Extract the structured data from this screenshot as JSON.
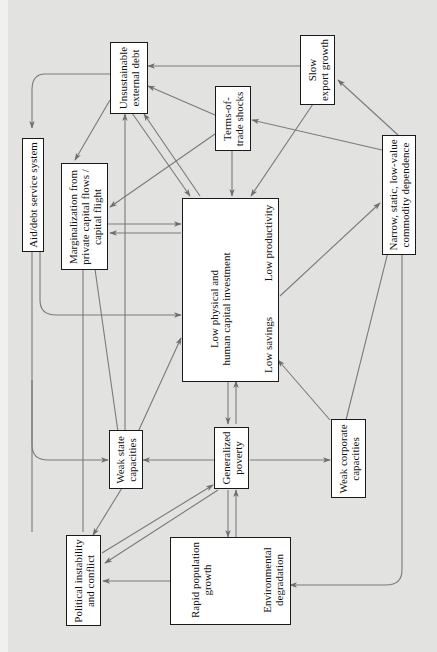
{
  "figure": {
    "orientation": "rotated-90-ccw",
    "line_color": "#777777",
    "box_border_color": "#1a1a1a",
    "background": "#e2e2e0"
  },
  "nodes": {
    "unsustainable_debt": {
      "line1": "Unsustainable",
      "line2": "external debt"
    },
    "slow_export": {
      "line1": "Slow",
      "line2": "export growth"
    },
    "terms_of_trade": {
      "line1": "Terms-of-",
      "line2": "trade shocks"
    },
    "aid_debt": {
      "line1": "Aid/debt service system"
    },
    "marginalization": {
      "line1": "Marginalization from",
      "line2": "private capital flows /",
      "line3": "capital flight"
    },
    "narrow_commodity": {
      "line1": "Narrow, static, low-value",
      "line2": "commodity dependence"
    },
    "center": {
      "investment_line1": "Low physical and",
      "investment_line2": "human capital investment",
      "productivity": "Low productivity",
      "savings": "Low savings"
    },
    "weak_state": {
      "line1": "Weak state",
      "line2": "capacities"
    },
    "generalized_poverty": {
      "line1": "Generalized",
      "line2": "poverty"
    },
    "weak_corporate": {
      "line1": "Weak corporate",
      "line2": "capacities"
    },
    "political_instability": {
      "line1": "Political instability",
      "line2": "and conflict"
    },
    "population_environment": {
      "population_line1": "Rapid population",
      "population_line2": "growth",
      "environment_line1": "Environmental",
      "environment_line2": "degradation"
    }
  },
  "edges": [
    {
      "from": "Slow export growth",
      "to": "Unsustainable external debt"
    },
    {
      "from": "Terms-of-trade shocks",
      "to": "Unsustainable external debt"
    },
    {
      "from": "Unsustainable external debt",
      "to": "Aid/debt service system"
    },
    {
      "from": "Unsustainable external debt",
      "to": "Marginalization from private capital flows / capital flight"
    },
    {
      "from": "Unsustainable external debt",
      "to": "Low physical and human capital investment"
    },
    {
      "from": "Low physical and human capital investment",
      "to": "Unsustainable external debt"
    },
    {
      "from": "Terms-of-trade shocks",
      "to": "Marginalization from private capital flows / capital flight"
    },
    {
      "from": "Terms-of-trade shocks",
      "to": "Low physical and human capital investment"
    },
    {
      "from": "Slow export growth",
      "to": "Low productivity"
    },
    {
      "from": "Narrow, static, low-value commodity dependence",
      "to": "Slow export growth"
    },
    {
      "from": "Narrow, static, low-value commodity dependence",
      "to": "Terms-of-trade shocks"
    },
    {
      "from": "Marginalization from private capital flows / capital flight",
      "to": "Low physical and human capital investment"
    },
    {
      "from": "Low physical and human capital investment",
      "to": "Marginalization from private capital flows / capital flight"
    },
    {
      "from": "Aid/debt service system",
      "to": "Low physical and human capital investment"
    },
    {
      "from": "Low physical and human capital investment",
      "to": "Low productivity"
    },
    {
      "from": "Low productivity",
      "to": "Low physical and human capital investment"
    },
    {
      "from": "Low productivity",
      "to": "Low savings"
    },
    {
      "from": "Low physical and human capital investment",
      "to": "Low savings"
    },
    {
      "from": "Low savings",
      "to": "Low physical and human capital investment"
    },
    {
      "from": "Low physical and human capital investment",
      "to": "Narrow, static, low-value commodity dependence"
    },
    {
      "from": "Low physical and human capital investment",
      "to": "Generalized poverty"
    },
    {
      "from": "Generalized poverty",
      "to": "Low physical and human capital investment"
    },
    {
      "from": "Weak corporate capacities",
      "to": "Low savings"
    },
    {
      "from": "Weak corporate capacities",
      "to": "Narrow, static, low-value commodity dependence"
    },
    {
      "from": "Weak state capacities",
      "to": "Low physical and human capital investment"
    },
    {
      "from": "Weak state capacities",
      "to": "Marginalization from private capital flows / capital flight"
    },
    {
      "from": "Weak state capacities",
      "to": "Unsustainable external debt"
    },
    {
      "from": "Generalized poverty",
      "to": "Weak state capacities"
    },
    {
      "from": "Generalized poverty",
      "to": "Weak corporate capacities"
    },
    {
      "from": "Aid/debt service system",
      "to": "Weak state capacities"
    },
    {
      "from": "Weak state capacities",
      "to": "Political instability and conflict"
    },
    {
      "from": "Political instability and conflict",
      "to": "Generalized poverty"
    },
    {
      "from": "Generalized poverty",
      "to": "Political instability and conflict"
    },
    {
      "from": "Political instability and conflict",
      "to": "Marginalization from private capital flows / capital flight"
    },
    {
      "from": "Generalized poverty",
      "to": "Rapid population growth"
    },
    {
      "from": "Rapid population growth",
      "to": "Generalized poverty"
    },
    {
      "from": "Rapid population growth",
      "to": "Environmental degradation"
    },
    {
      "from": "Environmental degradation",
      "to": "Rapid population growth"
    },
    {
      "from": "Rapid population growth",
      "to": "Political instability and conflict"
    },
    {
      "from": "Narrow, static, low-value commodity dependence",
      "to": "Environmental degradation"
    }
  ]
}
